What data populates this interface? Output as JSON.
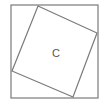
{
  "diagram": {
    "label": "C",
    "stroke_color": "#7a7a7a",
    "label_color": "#555555",
    "outer_square": {
      "x": 11,
      "y": 5,
      "size": 87
    },
    "inner_square": {
      "points": "38,6 97,33 73,97 12,71"
    },
    "label_position": {
      "x": 56,
      "y": 57
    }
  }
}
